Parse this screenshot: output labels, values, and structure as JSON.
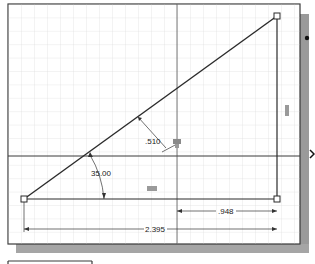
{
  "sketch": {
    "dimensions": {
      "hypotenuse_offset": ".510",
      "angle": "35.00",
      "partial_base": ".948",
      "base_length": "2.395"
    },
    "colors": {
      "grid": "#e2e2e2",
      "grid_major": "#d6d6d6",
      "line": "#2b2b2b",
      "frame": "#3a3a3a",
      "shadow": "#9a9a9a",
      "constraint_icon": "#8a8a8a",
      "background": "#ffffff"
    },
    "points": {
      "bottom_left": [
        24,
        199
      ],
      "top_right": [
        277,
        16
      ],
      "bottom_right": [
        277,
        199
      ]
    }
  },
  "side_marks": {
    "bullet": "•",
    "chevron": "❯"
  }
}
